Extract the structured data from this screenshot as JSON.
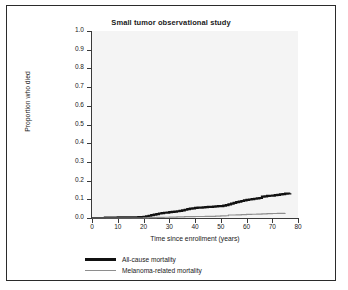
{
  "figure": {
    "border_color": "#2b2b2b",
    "background": "#ffffff"
  },
  "chart_data": {
    "type": "line",
    "title": "Small tumor observational study",
    "xlabel": "Time since enrollment (years)",
    "ylabel": "Proportion who died",
    "xlim": [
      0,
      80
    ],
    "ylim": [
      0,
      1.0
    ],
    "xticks": [
      0,
      10,
      20,
      30,
      40,
      50,
      60,
      70,
      80
    ],
    "xtick_labels": [
      "0",
      "10",
      "20",
      "30",
      "40",
      "50",
      "60",
      "70",
      "80"
    ],
    "yticks": [
      0.0,
      0.1,
      0.2,
      0.3,
      0.4,
      0.5,
      0.6,
      0.7,
      0.8,
      0.9,
      1.0
    ],
    "ytick_labels": [
      "0.0",
      "0.1",
      "0.2",
      "0.3",
      "0.4",
      "0.5",
      "0.6",
      "0.7",
      "0.8",
      "0.9",
      "1.0"
    ],
    "grid": false,
    "plot_background": "#f4f4f4",
    "legend_position": "below-axes-left",
    "series": [
      {
        "name": "All-cause mortality",
        "color": "#111111",
        "width": 2.2,
        "step": true,
        "x": [
          0,
          5,
          10,
          15,
          18,
          20,
          21,
          22,
          23,
          24,
          25,
          26,
          27,
          28,
          29,
          30,
          31,
          32,
          33,
          34,
          35,
          36,
          37,
          38,
          39,
          40,
          41,
          42,
          43,
          44,
          45,
          46,
          47,
          48,
          49,
          50,
          51,
          52,
          53,
          54,
          55,
          56,
          57,
          58,
          59,
          60,
          61,
          62,
          63,
          64,
          65,
          66,
          67,
          68,
          69,
          70,
          71,
          72,
          73,
          74,
          75,
          76,
          77
        ],
        "y": [
          0.0,
          0.002,
          0.003,
          0.004,
          0.005,
          0.006,
          0.009,
          0.012,
          0.015,
          0.018,
          0.021,
          0.024,
          0.026,
          0.028,
          0.029,
          0.031,
          0.033,
          0.034,
          0.036,
          0.038,
          0.041,
          0.044,
          0.047,
          0.05,
          0.052,
          0.054,
          0.055,
          0.056,
          0.057,
          0.058,
          0.059,
          0.06,
          0.061,
          0.062,
          0.063,
          0.064,
          0.066,
          0.069,
          0.073,
          0.077,
          0.081,
          0.085,
          0.088,
          0.091,
          0.094,
          0.097,
          0.099,
          0.101,
          0.103,
          0.105,
          0.107,
          0.114,
          0.116,
          0.118,
          0.119,
          0.12,
          0.122,
          0.124,
          0.126,
          0.128,
          0.13,
          0.131,
          0.132
        ]
      },
      {
        "name": "Melanoma-related mortality",
        "color": "#8e8e8e",
        "width": 1.2,
        "step": true,
        "x": [
          0,
          10,
          20,
          22,
          25,
          28,
          30,
          33,
          36,
          40,
          44,
          48,
          50,
          52,
          53,
          56,
          58,
          60,
          62,
          64,
          66,
          68,
          70,
          72,
          74,
          75
        ],
        "y": [
          0.0,
          0.0,
          0.001,
          0.002,
          0.003,
          0.004,
          0.005,
          0.006,
          0.007,
          0.008,
          0.009,
          0.01,
          0.011,
          0.012,
          0.016,
          0.017,
          0.018,
          0.019,
          0.02,
          0.021,
          0.022,
          0.023,
          0.024,
          0.025,
          0.025,
          0.026
        ]
      }
    ]
  },
  "legend": {
    "items": [
      {
        "label": "All-cause mortality",
        "color": "#111111"
      },
      {
        "label": "Melanoma-related mortality",
        "color": "#8e8e8e"
      }
    ]
  }
}
